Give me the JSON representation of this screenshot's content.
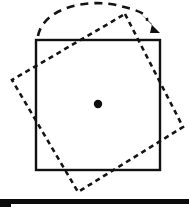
{
  "figure": {
    "background_color": "#ffffff",
    "ink_color": "#111111",
    "canvas": {
      "width": 189,
      "height": 211
    },
    "caption": ""
  },
  "chart_data": {
    "type": "diagram",
    "title": "Rotation of a square about its centre",
    "xlabel": "",
    "ylabel": "",
    "units": "pixels",
    "elements": [
      {
        "name": "original-square",
        "label": "Original square (solid outline)",
        "style": "solid",
        "stroke": "#111111",
        "stroke_width": 2.4,
        "points": [
          [
            36,
            40
          ],
          [
            160,
            40
          ],
          [
            160,
            170
          ],
          [
            36,
            170
          ]
        ]
      },
      {
        "name": "rotated-square",
        "label": "Rotated image of the square (dashed outline)",
        "style": "dashed",
        "stroke": "#141414",
        "stroke_width": 2.6,
        "dash_pattern": "5 4",
        "rotation_degrees": 28,
        "rotation_direction": "clockwise",
        "points": [
          [
            125,
            14
          ],
          [
            183,
            127
          ],
          [
            78,
            192
          ],
          [
            12,
            80
          ]
        ]
      },
      {
        "name": "centre-of-rotation",
        "label": "Centre of rotation",
        "style": "filled-dot",
        "fill": "#0d0d0d",
        "cx": 98,
        "cy": 104,
        "r": 4.2
      },
      {
        "name": "rotation-arc",
        "label": "Curved arrow showing direction of turn",
        "style": "dashed-arc",
        "stroke": "#141414",
        "dash_pattern": "8 6",
        "start": [
          38,
          36
        ],
        "end": [
          146,
          20
        ],
        "sweep": "clockwise"
      },
      {
        "name": "arrow-head",
        "label": "Arrowhead marking clockwise sense",
        "style": "filled-dart",
        "fill": "#0d0d0d",
        "tip": [
          160,
          33
        ],
        "points": [
          [
            141,
            14
          ],
          [
            160,
            33
          ],
          [
            150,
            33
          ],
          [
            152,
            24
          ]
        ]
      },
      {
        "name": "page-rule",
        "label": "Thick black rule at foot of figure",
        "style": "filled-bar",
        "fill": "#0b0b0b",
        "x": 0,
        "y": 199,
        "width": 189,
        "height": 8
      }
    ],
    "annotations": [],
    "legend": []
  }
}
